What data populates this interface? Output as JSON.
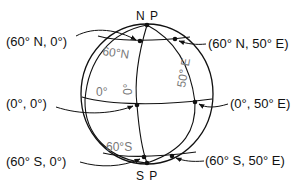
{
  "diagram": {
    "poles": {
      "north": "N P",
      "south": "S P"
    },
    "grid_labels": {
      "lat_north": "60°N",
      "lat_south": "60°S",
      "equator": "0°",
      "prime_meridian": "0°",
      "meridian_50e": "50° E"
    },
    "points": [
      {
        "id": "p-60n-0",
        "label": "(60° N, 0°)"
      },
      {
        "id": "p-60n-50e",
        "label": "(60° N, 50° E)"
      },
      {
        "id": "p-0-0",
        "label": "(0°, 0°)"
      },
      {
        "id": "p-0-50e",
        "label": "(0°, 50° E)"
      },
      {
        "id": "p-60s-0",
        "label": "(60° S, 0°)"
      },
      {
        "id": "p-60s-50e",
        "label": "(60° S, 50° E)"
      }
    ],
    "colors": {
      "line": "#111111",
      "grid_label": "#777777",
      "background": "#ffffff"
    }
  }
}
